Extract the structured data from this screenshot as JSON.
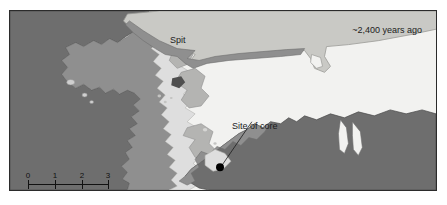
{
  "figure": {
    "caption_age": "~2,400 years ago",
    "label_spit": "Spit",
    "label_core": "Site of core"
  },
  "scale": {
    "ticks": [
      "0",
      "1",
      "2",
      "3"
    ],
    "units_label": "kilometers",
    "length_km": 3
  },
  "palette": {
    "page_background": "#ffffff",
    "frame_border": "#2b2b2b",
    "water": "#f2f2f0",
    "land_dark": "#6e6e6e",
    "marsh_mid": "#8f8f8f",
    "marsh_light": "#b4b4b2",
    "spit_sand": "#c9c9c5",
    "shoal_pale": "#dedede",
    "core_marker": "#000000",
    "label_text": "#1c1c1c"
  },
  "map_features": {
    "spit_hook_present": true,
    "core_site_marker": "filled-circle",
    "inlet_notch_right": true,
    "small_ponds_count": 3,
    "small_shoals_count": 5
  }
}
